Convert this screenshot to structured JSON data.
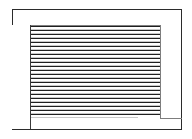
{
  "window": {
    "title": "",
    "frame_color": "#2b2b2b",
    "background_color": "#ffffff"
  },
  "header": {
    "label": "",
    "divider_color": "#808080"
  },
  "sidebar": {
    "label": "",
    "divider_color": "#3a3a3a",
    "items": []
  },
  "content": {
    "label": "",
    "rule_color": "#7d7d7d",
    "line_color": "#1f1f1f",
    "line_count": 23,
    "lines": [
      {
        "style": "full"
      },
      {
        "style": "full"
      },
      {
        "style": "full"
      },
      {
        "style": "full"
      },
      {
        "style": "full"
      },
      {
        "style": "full"
      },
      {
        "style": "full"
      },
      {
        "style": "full"
      },
      {
        "style": "full"
      },
      {
        "style": "full"
      },
      {
        "style": "full"
      },
      {
        "style": "full"
      },
      {
        "style": "full"
      },
      {
        "style": "full"
      },
      {
        "style": "full"
      },
      {
        "style": "full"
      },
      {
        "style": "full"
      },
      {
        "style": "full"
      },
      {
        "style": "full"
      },
      {
        "style": "full"
      },
      {
        "style": "full"
      },
      {
        "style": "full"
      },
      {
        "style": "short"
      }
    ]
  },
  "footer": {
    "label": "",
    "rule_color": "#7d7d7d"
  }
}
